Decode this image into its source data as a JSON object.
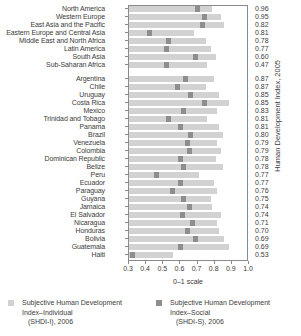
{
  "chart_data": {
    "type": "bar",
    "title": "",
    "xlabel": "0–1 scale",
    "ylabel": "Human Development Index, 2005",
    "xlim": [
      0.3,
      1.0
    ],
    "xticks": [
      "0.3",
      "0.4",
      "0.5",
      "0.6",
      "0.7",
      "0.8",
      "0.9",
      "1.0"
    ],
    "grid": false,
    "legend_position": "bottom",
    "value_column_header": "Human Development Index, 2005",
    "series": [
      {
        "name": "Subjective Human Development Index–Individual (SHDI-I), 2006",
        "color": "#d2d2d2",
        "shape": "bar"
      },
      {
        "name": "Subjective Human Development Index–Social (SHDI-S), 2006",
        "color": "#8e8e8e",
        "shape": "marker"
      }
    ],
    "groups": [
      {
        "name": "regions",
        "rows": [
          {
            "label": "North America",
            "shdi_i": 0.79,
            "shdi_s": 0.7,
            "hdi": "0.96"
          },
          {
            "label": "Western Europe",
            "shdi_i": 0.84,
            "shdi_s": 0.74,
            "hdi": "0.95"
          },
          {
            "label": "East Asia and the Pacific",
            "shdi_i": 0.86,
            "shdi_s": 0.73,
            "hdi": "0.82"
          },
          {
            "label": "Eastern Europe and Central Asia",
            "shdi_i": 0.68,
            "shdi_s": 0.42,
            "hdi": "0.81"
          },
          {
            "label": "Middle East and North Africa",
            "shdi_i": 0.75,
            "shdi_s": 0.53,
            "hdi": "0.78"
          },
          {
            "label": "Latin America",
            "shdi_i": 0.78,
            "shdi_s": 0.52,
            "hdi": "0.77"
          },
          {
            "label": "South Asia",
            "shdi_i": 0.81,
            "shdi_s": 0.69,
            "hdi": "0.60"
          },
          {
            "label": "Sub-Saharan Africa",
            "shdi_i": 0.76,
            "shdi_s": 0.52,
            "hdi": "0.47"
          }
        ]
      },
      {
        "name": "countries",
        "rows": [
          {
            "label": "Argentina",
            "shdi_i": 0.8,
            "shdi_s": 0.63,
            "hdi": "0.87"
          },
          {
            "label": "Chile",
            "shdi_i": 0.75,
            "shdi_s": 0.58,
            "hdi": "0.87"
          },
          {
            "label": "Uruguay",
            "shdi_i": 0.83,
            "shdi_s": 0.66,
            "hdi": "0.85"
          },
          {
            "label": "Costa Rica",
            "shdi_i": 0.89,
            "shdi_s": 0.74,
            "hdi": "0.85"
          },
          {
            "label": "Mexico",
            "shdi_i": 0.82,
            "shdi_s": 0.62,
            "hdi": "0.83"
          },
          {
            "label": "Trinidad and Tobago",
            "shdi_i": 0.76,
            "shdi_s": 0.53,
            "hdi": "0.81"
          },
          {
            "label": "Panama",
            "shdi_i": 0.83,
            "shdi_s": 0.6,
            "hdi": "0.81"
          },
          {
            "label": "Brazil",
            "shdi_i": 0.85,
            "shdi_s": 0.66,
            "hdi": "0.80"
          },
          {
            "label": "Venezuela",
            "shdi_i": 0.82,
            "shdi_s": 0.64,
            "hdi": "0.79"
          },
          {
            "label": "Colombia",
            "shdi_i": 0.84,
            "shdi_s": 0.65,
            "hdi": "0.79"
          },
          {
            "label": "Dominican Republic",
            "shdi_i": 0.81,
            "shdi_s": 0.6,
            "hdi": "0.78"
          },
          {
            "label": "Belize",
            "shdi_i": 0.85,
            "shdi_s": 0.62,
            "hdi": "0.78"
          },
          {
            "label": "Peru",
            "shdi_i": 0.71,
            "shdi_s": 0.46,
            "hdi": "0.77"
          },
          {
            "label": "Ecuador",
            "shdi_i": 0.8,
            "shdi_s": 0.6,
            "hdi": "0.77"
          },
          {
            "label": "Paraguay",
            "shdi_i": 0.82,
            "shdi_s": 0.55,
            "hdi": "0.76"
          },
          {
            "label": "Guyana",
            "shdi_i": 0.78,
            "shdi_s": 0.62,
            "hdi": "0.75"
          },
          {
            "label": "Jamaica",
            "shdi_i": 0.79,
            "shdi_s": 0.65,
            "hdi": "0.74"
          },
          {
            "label": "El Salvador",
            "shdi_i": 0.84,
            "shdi_s": 0.61,
            "hdi": "0.74"
          },
          {
            "label": "Nicaragua",
            "shdi_i": 0.82,
            "shdi_s": 0.67,
            "hdi": "0.71"
          },
          {
            "label": "Honduras",
            "shdi_i": 0.83,
            "shdi_s": 0.64,
            "hdi": "0.70"
          },
          {
            "label": "Bolivia",
            "shdi_i": 0.86,
            "shdi_s": 0.69,
            "hdi": "0.69"
          },
          {
            "label": "Guatemala",
            "shdi_i": 0.89,
            "shdi_s": 0.6,
            "hdi": "0.69"
          },
          {
            "label": "Haiti",
            "shdi_i": 0.56,
            "shdi_s": 0.32,
            "hdi": "0.53"
          }
        ]
      }
    ]
  },
  "legend": {
    "items": [
      {
        "line1": "Subjective Human Development",
        "line2": "Index–Individual",
        "line3": "(SHDI-I), 2006",
        "swatch": "#d2d2d2"
      },
      {
        "line1": "Subjective Human Development",
        "line2": "Index–Social",
        "line3": "(SHDI-S), 2006",
        "swatch": "#8e8e8e"
      }
    ]
  }
}
